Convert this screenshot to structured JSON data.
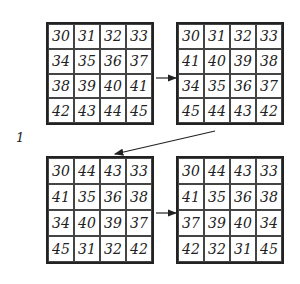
{
  "figure_label": "1",
  "grids": [
    {
      "name": "grid-1",
      "rows": [
        [
          "30",
          "31",
          "32",
          "33"
        ],
        [
          "34",
          "35",
          "36",
          "37"
        ],
        [
          "38",
          "39",
          "40",
          "41"
        ],
        [
          "42",
          "43",
          "44",
          "45"
        ]
      ]
    },
    {
      "name": "grid-2",
      "rows": [
        [
          "30",
          "31",
          "32",
          "33"
        ],
        [
          "41",
          "40",
          "39",
          "38"
        ],
        [
          "34",
          "35",
          "36",
          "37"
        ],
        [
          "45",
          "44",
          "43",
          "42"
        ]
      ]
    },
    {
      "name": "grid-3",
      "rows": [
        [
          "30",
          "44",
          "43",
          "33"
        ],
        [
          "41",
          "35",
          "36",
          "38"
        ],
        [
          "34",
          "40",
          "39",
          "37"
        ],
        [
          "45",
          "31",
          "32",
          "42"
        ]
      ]
    },
    {
      "name": "grid-4",
      "rows": [
        [
          "30",
          "44",
          "43",
          "33"
        ],
        [
          "41",
          "35",
          "36",
          "38"
        ],
        [
          "37",
          "39",
          "40",
          "34"
        ],
        [
          "42",
          "32",
          "31",
          "45"
        ]
      ]
    }
  ],
  "arrows": [
    {
      "from": "grid-1",
      "to": "grid-2"
    },
    {
      "from": "grid-2",
      "to": "grid-3"
    },
    {
      "from": "grid-3",
      "to": "grid-4"
    }
  ]
}
